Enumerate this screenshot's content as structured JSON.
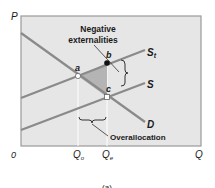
{
  "diagram": {
    "type": "supply-demand-externality",
    "axes": {
      "y_label": "P",
      "x_label": "Q",
      "origin_label": "0",
      "x_ticks": [
        {
          "label": "Q",
          "sub": "o"
        },
        {
          "label": "Q",
          "sub": "e"
        }
      ]
    },
    "curves": {
      "st_label": "S",
      "st_sub": "t",
      "s_label": "S",
      "d_label": "D"
    },
    "points": {
      "a": "a",
      "b": "b",
      "c": "c"
    },
    "annotations": {
      "negative_line1": "Negative",
      "negative_line2": "externalities",
      "overallocation": "Overallocation"
    },
    "caption": "(a)",
    "colors": {
      "plot_bg": "#e6e6e6",
      "curve": "#8a8a8a",
      "shade": "#b4b4b4",
      "text": "#1a1a1a"
    }
  }
}
